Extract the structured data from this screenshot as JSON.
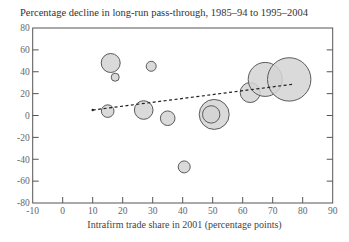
{
  "chart_data": {
    "type": "scatter",
    "subtype": "bubble",
    "title": "Percentage decline in long-run pass-through, 1985–94 to 1995–2004",
    "xlabel": "Intrafirm trade share in 2001 (percentage points)",
    "ylabel": "",
    "xlim": [
      -10,
      90
    ],
    "ylim": [
      -80,
      80
    ],
    "x_ticks": [
      -10,
      0,
      10,
      20,
      30,
      40,
      50,
      60,
      70,
      80,
      90
    ],
    "y_ticks": [
      -80,
      -60,
      -40,
      -20,
      0,
      20,
      40,
      60,
      80
    ],
    "grid": false,
    "legend": null,
    "points": [
      {
        "x": 16,
        "y": 48,
        "size": 9.5
      },
      {
        "x": 17.5,
        "y": 35,
        "size": 4
      },
      {
        "x": 29.5,
        "y": 45,
        "size": 5
      },
      {
        "x": 15,
        "y": 4,
        "size": 6.3
      },
      {
        "x": 27,
        "y": 5,
        "size": 9.3
      },
      {
        "x": 35,
        "y": -2.5,
        "size": 7.3
      },
      {
        "x": 50.5,
        "y": 1,
        "size": 15
      },
      {
        "x": 49.5,
        "y": 1,
        "size": 8.7
      },
      {
        "x": 40.5,
        "y": -47,
        "size": 6
      },
      {
        "x": 62.5,
        "y": 21,
        "size": 10
      },
      {
        "x": 67.5,
        "y": 33,
        "size": 17
      },
      {
        "x": 75.5,
        "y": 33,
        "size": 21.7
      }
    ],
    "trendline": {
      "style": "dashed",
      "x": [
        10,
        76.5
      ],
      "y": [
        5,
        28.5
      ]
    },
    "colors": {
      "bubble_fill": "#d3d3d3",
      "bubble_stroke": "#5a5a5a",
      "axis": "#555555",
      "trendline": "#222222"
    }
  }
}
